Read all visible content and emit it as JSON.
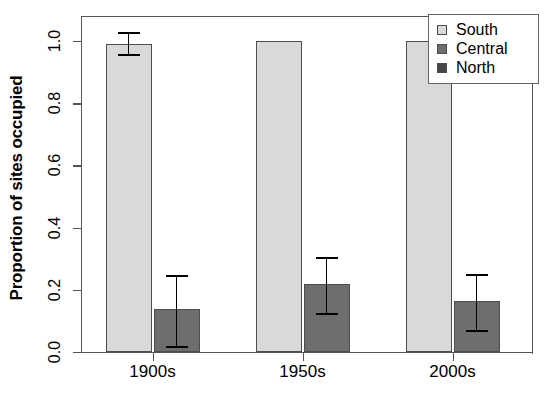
{
  "chart_data": {
    "type": "bar",
    "title": "",
    "xlabel": "",
    "ylabel": "Proportion of sites occupied",
    "categories": [
      "1900s",
      "1950s",
      "2000s"
    ],
    "ylim": [
      0.0,
      1.08
    ],
    "yticks": [
      "0.0",
      "0.2",
      "0.4",
      "0.6",
      "0.8",
      "1.0"
    ],
    "ytick_values": [
      0.0,
      0.2,
      0.4,
      0.6,
      0.8,
      1.0
    ],
    "grid": false,
    "legend_position": "top-right",
    "series": [
      {
        "name": "South",
        "color": "#d9d9d9",
        "values": [
          0.99,
          1.0,
          1.0
        ],
        "err_low": [
          0.955,
          1.0,
          1.0
        ],
        "err_high": [
          1.025,
          1.0,
          1.0
        ]
      },
      {
        "name": "Central",
        "color": "#6e6e6e",
        "values": [
          0.137,
          0.218,
          0.163
        ],
        "err_low": [
          0.015,
          0.121,
          0.068
        ],
        "err_high": [
          0.245,
          0.302,
          0.248
        ]
      },
      {
        "name": "North",
        "color": "#474747",
        "values": [
          0.0,
          0.0,
          0.0
        ],
        "err_low": [
          0.0,
          0.0,
          0.0
        ],
        "err_high": [
          0.0,
          0.0,
          0.0
        ]
      }
    ]
  },
  "legend": {
    "items": [
      {
        "label": "South",
        "color": "#d9d9d9"
      },
      {
        "label": "Central",
        "color": "#6e6e6e"
      },
      {
        "label": "North",
        "color": "#474747"
      }
    ]
  },
  "axes": {
    "y_title": "Proportion of sites occupied",
    "y_ticks": [
      "0.0",
      "0.2",
      "0.4",
      "0.6",
      "0.8",
      "1.0"
    ],
    "x_ticks": [
      "1900s",
      "1950s",
      "2000s"
    ]
  }
}
